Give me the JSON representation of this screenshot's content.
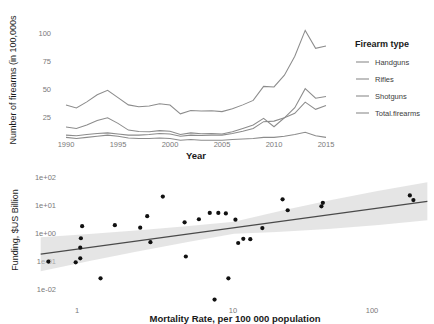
{
  "figure": {
    "title": "",
    "panels": [
      "firearms-timeseries",
      "funding-vs-mortality-scatter"
    ]
  },
  "chart_data": [
    {
      "id": "panel-top",
      "type": "line",
      "title": "",
      "xlabel": "Year",
      "ylabel": "Number of firearms (in 100,000s",
      "xlim": [
        1990,
        2015
      ],
      "ylim": [
        0,
        110
      ],
      "xticks": [
        1990,
        1995,
        2000,
        2005,
        2010,
        2015
      ],
      "yticks": [
        25,
        50,
        75,
        100
      ],
      "xtick_labels": [
        "1990",
        "1995",
        "2000",
        "2005",
        "2010",
        "2015"
      ],
      "ytick_labels": [
        "25",
        "50",
        "75",
        "100"
      ],
      "grid": false,
      "legend": {
        "title": "Firearm type",
        "position": "right",
        "entries": [
          "Handguns",
          "Rifles",
          "Shotguns",
          "Total.firearms"
        ]
      },
      "x": [
        1990,
        1991,
        1992,
        1993,
        1994,
        1995,
        1996,
        1997,
        1998,
        1999,
        2000,
        2001,
        2002,
        2003,
        2004,
        2005,
        2006,
        2007,
        2008,
        2009,
        2010,
        2011,
        2012,
        2013,
        2014,
        2015
      ],
      "series": [
        {
          "name": "Total.firearms",
          "color": "#8c8c8c",
          "values": [
            38.5,
            35.8,
            41.2,
            47.5,
            51.5,
            45.0,
            38.5,
            36.8,
            37.5,
            39.5,
            38.3,
            30.5,
            33.5,
            33.0,
            33.2,
            32.5,
            35.0,
            38.5,
            42.5,
            55.0,
            54.5,
            65.0,
            82.0,
            105.0,
            89.0,
            91.0
          ]
        },
        {
          "name": "Handguns",
          "color": "#8c8c8c",
          "values": [
            18.8,
            17.5,
            20.5,
            24.5,
            27.0,
            22.0,
            16.0,
            14.8,
            14.5,
            15.5,
            15.0,
            12.0,
            13.5,
            12.8,
            13.0,
            12.5,
            14.5,
            17.5,
            20.5,
            26.5,
            19.0,
            27.0,
            36.0,
            53.0,
            44.5,
            46.0
          ]
        },
        {
          "name": "Rifles",
          "color": "#8c8c8c",
          "values": [
            11.5,
            11.0,
            12.0,
            13.0,
            13.5,
            12.5,
            11.5,
            11.5,
            12.0,
            13.0,
            12.5,
            10.5,
            11.5,
            11.2,
            11.5,
            11.5,
            13.0,
            15.0,
            17.5,
            23.5,
            24.0,
            27.0,
            31.0,
            41.0,
            34.5,
            38.0
          ]
        },
        {
          "name": "Shotguns",
          "color": "#8c8c8c",
          "values": [
            9.5,
            8.5,
            9.5,
            10.5,
            11.5,
            10.5,
            9.0,
            8.5,
            8.5,
            9.0,
            8.5,
            7.0,
            7.5,
            7.0,
            7.0,
            7.0,
            7.5,
            8.0,
            8.5,
            9.5,
            9.5,
            10.5,
            12.0,
            14.0,
            11.0,
            9.5
          ]
        }
      ]
    },
    {
      "id": "panel-bottom",
      "type": "scatter",
      "title": "",
      "xlabel": "Mortality Rate, per 100 000 population",
      "ylabel": "Funding, $US Billion",
      "xscale": "log",
      "yscale": "log",
      "xlim": [
        0.5,
        250
      ],
      "ylim": [
        0.003,
        150
      ],
      "xticks": [
        1,
        10,
        100
      ],
      "xtick_labels": [
        "1",
        "10",
        "100"
      ],
      "yticks": [
        0.01,
        0.1,
        1,
        10,
        100
      ],
      "ytick_labels": [
        "1e-02",
        "1e-01",
        "1e+00",
        "1e+01",
        "1e+02"
      ],
      "grid": false,
      "points": [
        [
          0.62,
          0.095
        ],
        [
          0.95,
          0.09
        ],
        [
          1.02,
          0.125
        ],
        [
          1.02,
          0.3
        ],
        [
          1.03,
          0.65
        ],
        [
          1.05,
          1.75
        ],
        [
          1.4,
          0.024
        ],
        [
          1.75,
          1.9
        ],
        [
          2.6,
          1.55
        ],
        [
          2.9,
          4.0
        ],
        [
          3.05,
          0.47
        ],
        [
          3.7,
          20.0
        ],
        [
          5.2,
          2.4
        ],
        [
          5.3,
          0.145
        ],
        [
          6.5,
          3.1
        ],
        [
          7.7,
          5.2
        ],
        [
          8.3,
          0.0042
        ],
        [
          8.8,
          5.2
        ],
        [
          9.9,
          5.0
        ],
        [
          10.3,
          0.024
        ],
        [
          11.5,
          3.0
        ],
        [
          12.0,
          0.44
        ],
        [
          13.0,
          0.62
        ],
        [
          14.5,
          0.6
        ],
        [
          17.5,
          1.5
        ],
        [
          24.0,
          16.0
        ],
        [
          26.0,
          6.5
        ],
        [
          44.0,
          9.0
        ],
        [
          45.0,
          12.0
        ],
        [
          175.0,
          22.0
        ],
        [
          185.0,
          15.0
        ]
      ],
      "regression": {
        "type": "linear-on-log-log",
        "x_start": 0.55,
        "y_start": 0.175,
        "x_end": 230,
        "y_end": 13.5,
        "confidence_band": true
      }
    }
  ]
}
